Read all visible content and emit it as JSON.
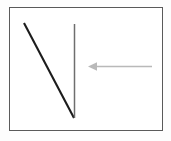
{
  "figure": {
    "canvas": {
      "width": 171,
      "height": 141,
      "background_color": "#fdfdfd"
    },
    "frame": {
      "name": "image-border",
      "x": 9,
      "y": 7,
      "width": 153,
      "height": 123,
      "stroke_color": "#5a5a5a",
      "stroke_width": 1,
      "fill_color": "#ffffff"
    },
    "shapes": [
      {
        "name": "diagonal-stroke",
        "type": "line",
        "x1": 24,
        "y1": 23,
        "x2": 74,
        "y2": 118,
        "stroke_color": "#1c1c1c",
        "stroke_width": 2.1
      },
      {
        "name": "vertical-stroke",
        "type": "line",
        "x1": 74.5,
        "y1": 24,
        "x2": 74.5,
        "y2": 118,
        "stroke_color": "#6e6e6e",
        "stroke_width": 1.5
      }
    ],
    "arrow": {
      "name": "pointer-arrow",
      "direction": "left",
      "color": "#b9b9b9",
      "shaft": {
        "x1": 152,
        "y1": 66,
        "x2": 95,
        "y2": 66,
        "stroke_width": 1.3
      },
      "head": {
        "tip_x": 88,
        "tip_y": 66,
        "back_x": 97,
        "half_height": 4.2
      }
    }
  }
}
